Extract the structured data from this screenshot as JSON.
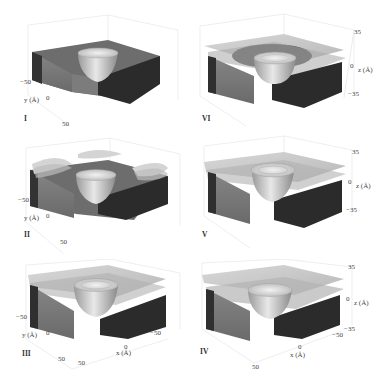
{
  "figure": {
    "panels": [
      {
        "id": "I",
        "position": "top-left",
        "roman": "I",
        "layers": "none",
        "y_axis": {
          "label": "y (Å)",
          "ticks": [
            "−50",
            "0",
            "50"
          ]
        }
      },
      {
        "id": "VI",
        "position": "top-right",
        "roman": "VI",
        "layers": "ring",
        "z_axis": {
          "label": "z (Å)",
          "ticks": [
            "35",
            "0",
            "−35"
          ]
        }
      },
      {
        "id": "II",
        "position": "middle-left",
        "roman": "II",
        "layers": "patches",
        "y_axis": {
          "label": "y (Å)",
          "ticks": [
            "−50",
            "0",
            "50"
          ]
        }
      },
      {
        "id": "V",
        "position": "middle-right",
        "roman": "V",
        "layers": "full-with-ring",
        "z_axis": {
          "label": "z (Å)",
          "ticks": [
            "35",
            "0",
            "−35"
          ]
        }
      },
      {
        "id": "III",
        "position": "bottom-left",
        "roman": "III",
        "layers": "full-with-ring",
        "y_axis": {
          "label": "y (Å)",
          "ticks": [
            "−50",
            "0",
            "50"
          ]
        },
        "x_axis": {
          "label": "x (Å)",
          "ticks": [
            "−50",
            "0",
            "50"
          ]
        }
      },
      {
        "id": "IV",
        "position": "bottom-right",
        "roman": "IV",
        "layers": "full-flat",
        "z_axis": {
          "label": "z (Å)",
          "ticks": [
            "35",
            "0",
            "−35"
          ]
        },
        "x_axis": {
          "label": "x (Å)",
          "ticks": [
            "−50",
            "0",
            "50"
          ]
        }
      }
    ],
    "colors": {
      "slab_top": "#6e6e6e",
      "slab_front": "#7a7a7a",
      "slab_dark": "#2a2a2a",
      "sheet": "#c8c8c8",
      "pit": "#d6d6d6",
      "bbox": "#dddddd"
    }
  }
}
